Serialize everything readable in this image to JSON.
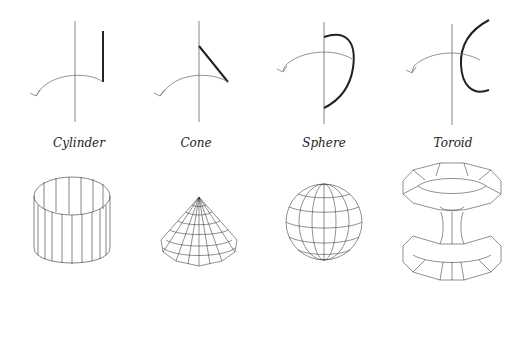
{
  "figure": {
    "shapes": [
      {
        "name": "Cylinder",
        "profile": "vertical line segment parallel to axis",
        "label_x": 79
      },
      {
        "name": "Cone",
        "profile": "slanted line segment meeting axis",
        "label_x": 196
      },
      {
        "name": "Sphere",
        "profile": "half circle arc with ends on axis",
        "label_x": 324
      },
      {
        "name": "Toroid",
        "profile": "arc concave toward axis, offset from axis",
        "label_x": 453
      }
    ],
    "colors": {
      "axis": "#555555",
      "profile": "#222222",
      "rotation_arrow": "#777777",
      "mesh": "#333333"
    }
  }
}
